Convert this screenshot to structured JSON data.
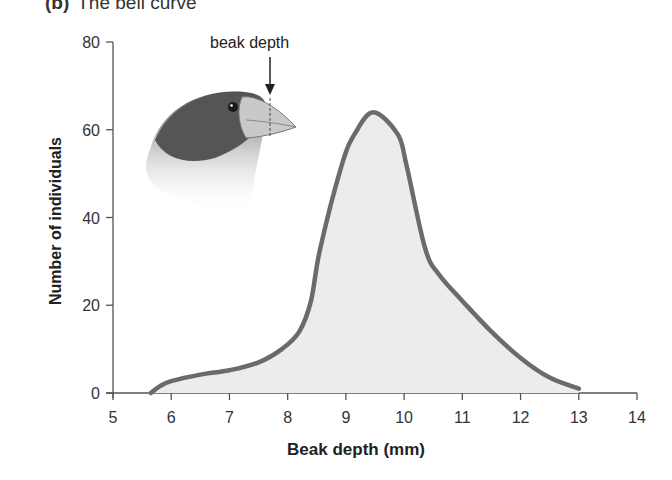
{
  "figure": {
    "panel_label": "(b)",
    "title": "The bell curve",
    "annotation": "beak depth",
    "illustration": "finch-head-icon"
  },
  "colors": {
    "curve_stroke": "#6b6b6b",
    "curve_fill": "#ececec",
    "axis": "#555555",
    "text": "#222222"
  },
  "chart_data": {
    "type": "area",
    "xlabel": "Beak depth (mm)",
    "ylabel": "Number of individuals",
    "xlim": [
      5,
      14
    ],
    "ylim": [
      0,
      80
    ],
    "xticks": [
      5,
      6,
      7,
      8,
      9,
      10,
      11,
      12,
      13,
      14
    ],
    "yticks": [
      0,
      20,
      40,
      60,
      80
    ],
    "grid": false,
    "legend": null,
    "annotations": [
      {
        "text": "beak depth",
        "note": "arrow pointing to depth of beak on finch head illustration"
      }
    ],
    "series": [
      {
        "name": "Beak depth distribution",
        "x": [
          5.65,
          5.8,
          6.0,
          6.5,
          7.0,
          7.5,
          7.9,
          8.2,
          8.4,
          8.56,
          8.93,
          9.15,
          9.47,
          9.89,
          10.04,
          10.36,
          10.6,
          11.0,
          11.5,
          12.0,
          12.5,
          13.0
        ],
        "y": [
          0,
          1.5,
          2.7,
          4.2,
          5.2,
          7,
          10,
          14,
          21,
          33,
          52,
          59,
          64,
          59,
          52,
          33,
          27,
          21,
          14,
          8,
          3.5,
          1
        ]
      }
    ]
  }
}
